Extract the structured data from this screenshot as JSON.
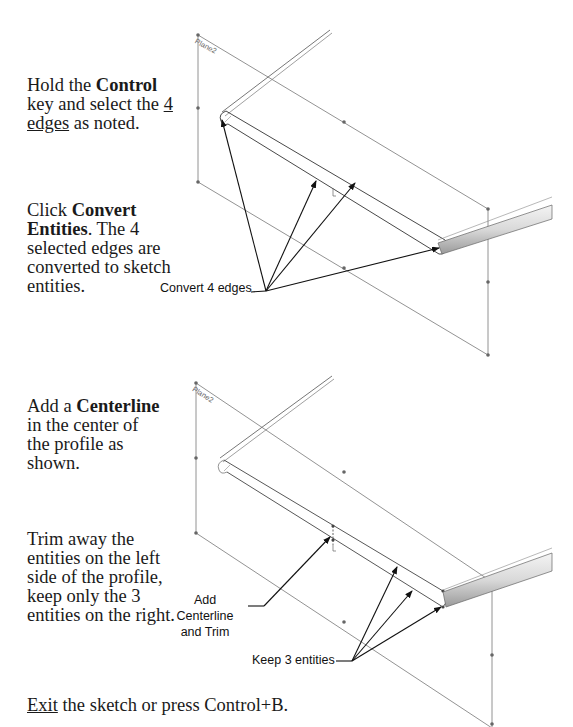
{
  "steps": [
    {
      "id": "step1",
      "pre": "Hold the ",
      "bold": "Control",
      "mid": " key and select the ",
      "underline": "4 edges",
      "post": " as noted."
    },
    {
      "id": "step2",
      "pre": "Click ",
      "bold": "Convert Entities",
      "post": ". The 4 selected edges are converted to sketch entities."
    },
    {
      "id": "step3",
      "pre": "Add a ",
      "bold": "Centerline",
      "post": " in the center of the profile as shown."
    },
    {
      "id": "step4",
      "text": "Trim away the entities on the left side of the profile, keep only the 3 entities on the right."
    },
    {
      "id": "step5",
      "underline": "Exit",
      "post": " the sketch or press Control+B."
    }
  ],
  "figures": {
    "top": {
      "plane_label": "Plane2",
      "callout": "Convert 4 edges"
    },
    "bottom": {
      "plane_label": "Plane2",
      "callout_centerline_line1": "Add Centerline",
      "callout_centerline_line2": "and Trim",
      "callout_keep": "Keep 3 entities"
    }
  },
  "colors": {
    "text": "#1a1a1a",
    "plane_lines": "#6e6e6e",
    "arrows": "#111111",
    "model_edges": "#555555"
  }
}
